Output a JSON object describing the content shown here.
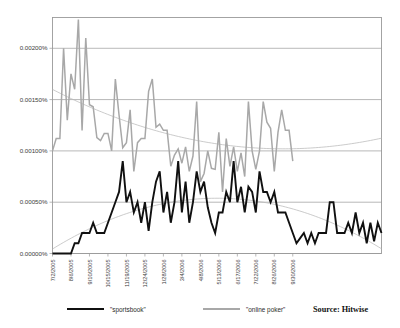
{
  "chart_data": {
    "type": "line",
    "title": "",
    "subtitle": "",
    "xlabel": "",
    "ylabel": "",
    "ylim": [
      0,
      0.0023
    ],
    "yticks": [
      "0.00000%",
      "0.00050%",
      "0.00100%",
      "0.00150%",
      "0.00200%"
    ],
    "ytick_values": [
      0,
      0.0005,
      0.001,
      0.0015,
      0.002
    ],
    "grid": true,
    "legend_position": "bottom",
    "source": "Source: Hitwise",
    "xtick_labels": [
      "7/2/2005",
      "8/6/2005",
      "9/10/2005",
      "10/15/2005",
      "11/19/2005",
      "12/24/2005",
      "1/28/2006",
      "3/4/2006",
      "4/8/2006",
      "5/13/2006",
      "6/17/2006",
      "7/22/2006",
      "8/26/2006",
      "9/30/2006"
    ],
    "xtick_indices": [
      0,
      5,
      10,
      15,
      20,
      25,
      30,
      35,
      40,
      45,
      50,
      55,
      60,
      65
    ],
    "series": [
      {
        "name": "\"sportsbook\"",
        "color": "#101010",
        "values": [
          0.0,
          0.0,
          0.0,
          0.0,
          0.0,
          0.0,
          0.0001,
          0.0001,
          0.0002,
          0.0002,
          0.0002,
          0.0003,
          0.0002,
          0.0002,
          0.0002,
          0.0003,
          0.0004,
          0.0005,
          0.0006,
          0.0009,
          0.0005,
          0.0006,
          0.0004,
          0.0005,
          0.0003,
          0.0005,
          0.00022,
          0.0005,
          0.0007,
          0.0008,
          0.0004,
          0.0006,
          0.0003,
          0.0005,
          0.0009,
          0.0004,
          0.0007,
          0.0003,
          0.0005,
          0.0008,
          0.0006,
          0.0007,
          0.00045,
          0.0003,
          0.0002,
          0.0004,
          0.0004,
          0.0006,
          0.0005,
          0.0009,
          0.0005,
          0.00065,
          0.0004,
          0.00065,
          0.0006,
          0.0004,
          0.0008,
          0.0006,
          0.0006,
          0.0005,
          0.0006,
          0.0004,
          0.0004,
          0.0004,
          0.0003,
          0.0002,
          0.0001,
          0.00015,
          0.0002,
          0.0001,
          0.0002,
          0.0001,
          0.0002,
          0.0002,
          0.0002,
          0.0005,
          0.0005,
          0.0002,
          0.0002,
          0.0002,
          0.0003,
          0.0002,
          0.0004,
          0.0002,
          0.0003,
          0.0001,
          0.0003,
          0.00012,
          0.0003,
          0.0002
        ]
      },
      {
        "name": "\"online poker\"",
        "color": "#a8a8a8",
        "values": [
          0.001,
          0.00112,
          0.00112,
          0.002,
          0.0013,
          0.00175,
          0.0016,
          0.00228,
          0.0012,
          0.0021,
          0.00145,
          0.00143,
          0.00113,
          0.0011,
          0.00117,
          0.00117,
          0.001,
          0.0017,
          0.00135,
          0.00103,
          0.00108,
          0.0014,
          0.0008,
          0.00108,
          0.00112,
          0.00112,
          0.00158,
          0.0017,
          0.00123,
          0.00126,
          0.0012,
          0.0012,
          0.00085,
          0.00096,
          0.00102,
          0.00088,
          0.00104,
          0.0008,
          0.00095,
          0.00148,
          0.0007,
          0.00078,
          0.001,
          0.00083,
          0.00082,
          0.00118,
          0.0006,
          0.00112,
          0.00085,
          0.00104,
          0.0008,
          0.00098,
          0.00075,
          0.00148,
          0.001,
          0.00082,
          0.001,
          0.00148,
          0.00128,
          0.00122,
          0.0008,
          0.00118,
          0.0014,
          0.0012,
          0.0012,
          0.0009
        ]
      }
    ],
    "trendlines": [
      {
        "name": "sportsbook-trend",
        "type": "polynomial",
        "color": "#b9b9b9"
      },
      {
        "name": "online-poker-trend",
        "type": "polynomial",
        "color": "#b9b9b9"
      }
    ]
  },
  "legend": {
    "items": [
      {
        "label": "\"sportsbook\"",
        "color": "#101010"
      },
      {
        "label": "\"online poker\"",
        "color": "#a8a8a8"
      }
    ],
    "source": "Source: Hitwise"
  }
}
